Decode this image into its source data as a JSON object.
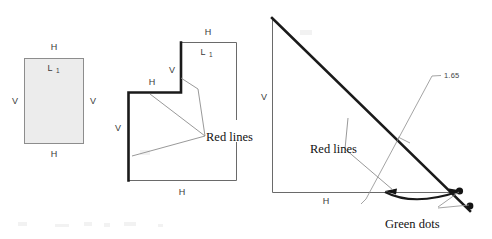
{
  "figure": {
    "colors": {
      "shade_fill": "#ececec",
      "thin_stroke": "#8d8d8d",
      "bold_stroke": "#1a1a1a",
      "text": "#111111"
    },
    "panels": [
      {
        "id": "rectangle",
        "name": "shaded-rectangle",
        "labels": {
          "top": "H",
          "bottom": "H",
          "left": "V",
          "right": "V",
          "inner": "L",
          "inner_sub": "1"
        }
      },
      {
        "id": "notched-polygon",
        "name": "l-shaped-polygon",
        "labels": {
          "top": "H",
          "bottom": "H",
          "left": "V",
          "notch_vertical": "V",
          "notch_horizontal": "H",
          "inner": "L",
          "inner_sub": "1",
          "annotation": "Red lines"
        }
      },
      {
        "id": "right-triangle",
        "name": "right-triangle",
        "labels": {
          "vertical": "V",
          "horizontal": "H",
          "annotation_red": "Red lines",
          "annotation_green": "Green dots",
          "dimension": "1.65"
        }
      }
    ]
  }
}
